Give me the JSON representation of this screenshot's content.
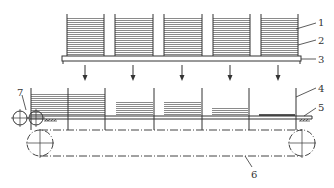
{
  "diagram": {
    "type": "mechanical-schematic",
    "colors": {
      "line": "#333333",
      "hatch": "#8a8a8a",
      "background": "#ffffff"
    },
    "top_section": {
      "stack_count": 5,
      "stacks": [
        {
          "x": 67,
          "w": 37
        },
        {
          "x": 115,
          "w": 38
        },
        {
          "x": 164,
          "w": 38
        },
        {
          "x": 213,
          "w": 37
        },
        {
          "x": 261,
          "w": 37
        }
      ],
      "stack_top": 14,
      "stack_bottom": 56,
      "base_plate": {
        "x": 62,
        "y": 56,
        "w": 239,
        "h": 5
      },
      "arrows_x": [
        85,
        133,
        182,
        230,
        278
      ]
    },
    "bottom_section": {
      "dividers_x": [
        31,
        68,
        105,
        154,
        202,
        249,
        296
      ],
      "stacks": [
        {
          "x": 31,
          "w": 74,
          "top": 92
        },
        {
          "x": 116,
          "w": 37,
          "top": 101
        },
        {
          "x": 164,
          "w": 37,
          "top": 101
        },
        {
          "x": 212,
          "w": 36,
          "top": 107
        },
        {
          "x": 259,
          "w": 36,
          "top": 114
        }
      ],
      "belt_y": 116,
      "pulleys": [
        {
          "cx": 40,
          "cy": 143,
          "r": 13
        },
        {
          "cx": 302,
          "cy": 143,
          "r": 13
        }
      ],
      "rollers": [
        {
          "cx": 20,
          "cy": 118,
          "r": 7
        },
        {
          "cx": 36,
          "cy": 118,
          "r": 7
        }
      ]
    },
    "labels": [
      {
        "id": "label-1",
        "text": "1"
      },
      {
        "id": "label-2",
        "text": "2"
      },
      {
        "id": "label-3",
        "text": "3"
      },
      {
        "id": "label-4",
        "text": "4"
      },
      {
        "id": "label-5",
        "text": "5"
      },
      {
        "id": "label-6",
        "text": "6"
      },
      {
        "id": "label-7",
        "text": "7"
      }
    ]
  }
}
